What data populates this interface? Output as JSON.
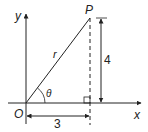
{
  "diagram": {
    "labels": {
      "y_axis": "y",
      "x_axis": "x",
      "origin": "O",
      "point": "P",
      "hypotenuse": "r",
      "angle": "θ",
      "vertical_length": "4",
      "horizontal_length": "3"
    },
    "colors": {
      "stroke": "#222222",
      "background": "#ffffff"
    }
  }
}
